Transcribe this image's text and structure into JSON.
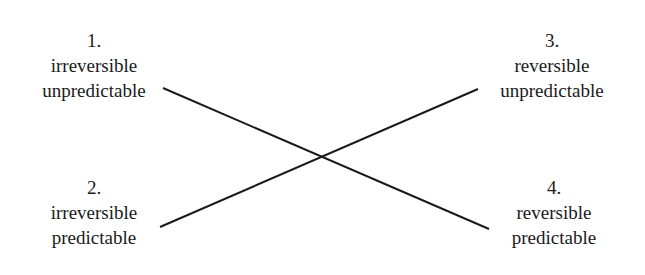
{
  "diagram": {
    "type": "crossing-lines-quadrant",
    "nodes": [
      {
        "number": "1.",
        "line1": "irreversible",
        "line2": "unpredictable"
      },
      {
        "number": "2.",
        "line1": "irreversible",
        "line2": "predictable"
      },
      {
        "number": "3.",
        "line1": "reversible",
        "line2": "unpredictable"
      },
      {
        "number": "4.",
        "line1": "reversible",
        "line2": "predictable"
      }
    ],
    "edges": [
      {
        "from": "1",
        "to": "4"
      },
      {
        "from": "2",
        "to": "3"
      }
    ],
    "line_color": "#1a1a1a"
  }
}
